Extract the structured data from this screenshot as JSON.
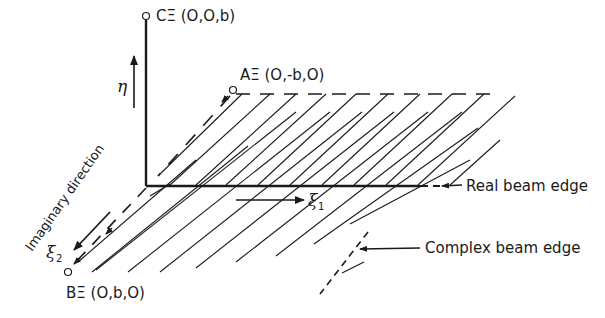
{
  "diagram": {
    "points": {
      "C": {
        "label": "CΞ (O,O,b)"
      },
      "A": {
        "label": "AΞ (O,-b,O)"
      },
      "B": {
        "label": "BΞ (O,b,O)"
      }
    },
    "axes": {
      "eta": {
        "symbol": "η"
      },
      "xi1": {
        "symbol": "ξ",
        "subscript": "1"
      },
      "xi2": {
        "symbol": "ξ",
        "subscript": "2"
      }
    },
    "annotations": {
      "imaginary_direction": "Imaginary direction",
      "real_beam_edge": "Real beam edge",
      "complex_beam_edge": "Complex beam edge"
    },
    "colors": {
      "ink": "#1a1a1a",
      "background": "#ffffff"
    }
  }
}
